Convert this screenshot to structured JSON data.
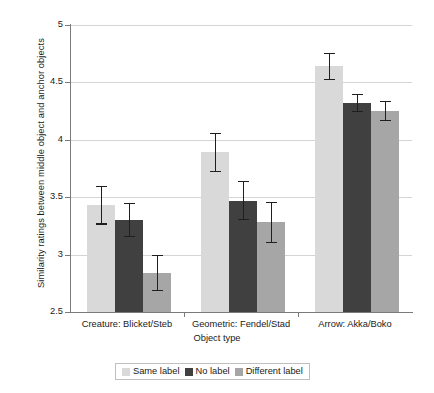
{
  "chart_data": {
    "type": "bar",
    "title": "",
    "xlabel": "Object type",
    "ylabel": "Similarity ratings between middle object and anchor objects",
    "categories": [
      "Creature: Blicket/Steb",
      "Geometric: Fendel/Stad",
      "Arrow: Akka/Boko"
    ],
    "ylim": [
      2.5,
      5
    ],
    "ytick_labels": [
      "2.5",
      "3",
      "3.5",
      "4",
      "4.5",
      "5"
    ],
    "yticks": [
      2.5,
      3,
      3.5,
      4,
      4.5,
      5
    ],
    "grid": true,
    "legend_position": "bottom",
    "series": [
      {
        "name": "Same label",
        "color": "#d9d9d9",
        "values": [
          3.43,
          3.89,
          4.64
        ],
        "errors": [
          0.17,
          0.17,
          0.12
        ]
      },
      {
        "name": "No label",
        "color": "#404040",
        "values": [
          3.3,
          3.47,
          4.32
        ],
        "errors": [
          0.15,
          0.17,
          0.08
        ]
      },
      {
        "name": "Different label",
        "color": "#a6a6a6",
        "values": [
          2.84,
          3.28,
          4.25
        ],
        "errors": [
          0.16,
          0.18,
          0.09
        ]
      }
    ]
  },
  "axis": {
    "y_title": "Similarity ratings between middle object and anchor objects",
    "x_title": "Object type",
    "y_labels": [
      "5",
      "4.5",
      "4",
      "3.5",
      "3",
      "2.5"
    ],
    "x_labels": [
      "Creature: Blicket/Steb",
      "Geometric: Fendel/Stad",
      "Arrow: Akka/Boko"
    ]
  },
  "legend": {
    "items": [
      {
        "label": "Same label",
        "color": "#d9d9d9"
      },
      {
        "label": "No label",
        "color": "#404040"
      },
      {
        "label": "Different label",
        "color": "#a6a6a6"
      }
    ]
  }
}
